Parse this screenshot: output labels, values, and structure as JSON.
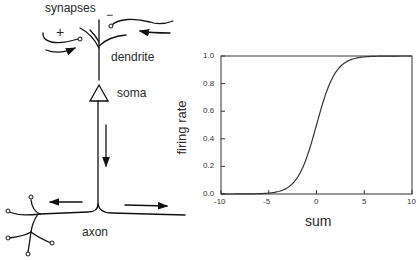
{
  "neuron": {
    "labels": {
      "synapses": "synapses",
      "plus": "+",
      "minus": "−",
      "dendrite": "dendrite",
      "soma": "soma",
      "axon": "axon"
    }
  },
  "chart_data": {
    "type": "line",
    "title": "",
    "xlabel": "sum",
    "ylabel": "firing rate",
    "xlim": [
      -10,
      10
    ],
    "ylim": [
      0,
      1
    ],
    "xticks": [
      "-10",
      "-5",
      "0",
      "5",
      "10"
    ],
    "yticks": [
      "0.0",
      "0.2",
      "0.4",
      "0.6",
      "0.8",
      "1.0"
    ],
    "grid": false,
    "legend": null,
    "series": [
      {
        "name": "sigmoid",
        "x": [
          -10,
          -8,
          -6,
          -5,
          -4,
          -3,
          -2,
          -1,
          0,
          1,
          2,
          3,
          4,
          5,
          6,
          8,
          10
        ],
        "values": [
          0.0,
          0.0,
          0.0,
          0.01,
          0.02,
          0.05,
          0.12,
          0.27,
          0.5,
          0.73,
          0.88,
          0.95,
          0.98,
          0.99,
          1.0,
          1.0,
          1.0
        ]
      }
    ]
  }
}
